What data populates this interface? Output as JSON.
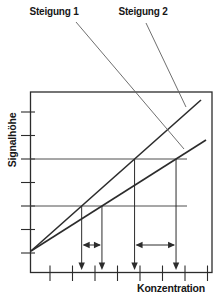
{
  "figure": {
    "width": 218,
    "height": 301,
    "colors": {
      "background": "#ffffff",
      "ink": "#2c2c2c",
      "grid": "#4f4f4f",
      "leader": "#5f5f5f",
      "text": "#161616"
    },
    "labels": {
      "slope1": {
        "text": "Steigung 1",
        "x": 54,
        "y": 15
      },
      "slope2": {
        "text": "Steigung 2",
        "x": 143,
        "y": 15
      },
      "y_axis": {
        "text": "Signalhöhe",
        "x": 16,
        "y": 140,
        "rotation": -90
      },
      "x_axis": {
        "text": "Konzentration",
        "x": 171,
        "y": 292
      }
    },
    "box": {
      "left": 30.5,
      "top": 92,
      "right": 212,
      "bottom": 272.5
    },
    "y_ticks": [
      112,
      135.5,
      159,
      182.5,
      206,
      229.5,
      253
    ],
    "y_tick_x": [
      21,
      35
    ],
    "x_ticks": [
      50,
      72.5,
      95,
      117.5,
      140,
      162.5,
      185,
      207.5
    ],
    "x_tick_y": [
      265.5,
      281
    ],
    "origin": {
      "x": 31,
      "y": 251
    },
    "calibration_lines": [
      {
        "name": "steigung-2-line",
        "x2": 201,
        "y2": 100
      },
      {
        "name": "steigung-1-line",
        "x2": 206,
        "y2": 140
      }
    ],
    "gridlines": {
      "y_upper": 159,
      "y_lower": 206,
      "x_end": 187
    },
    "leader_lines": [
      {
        "name": "steigung-1-leader",
        "x1": 76,
        "y1": 22,
        "x2": 184,
        "y2": 149
      },
      {
        "name": "steigung-2-leader",
        "x1": 146,
        "y1": 23,
        "x2": 186,
        "y2": 107
      }
    ],
    "drop_arrow_tip_y": 270,
    "range_arrow_y": 245
  }
}
